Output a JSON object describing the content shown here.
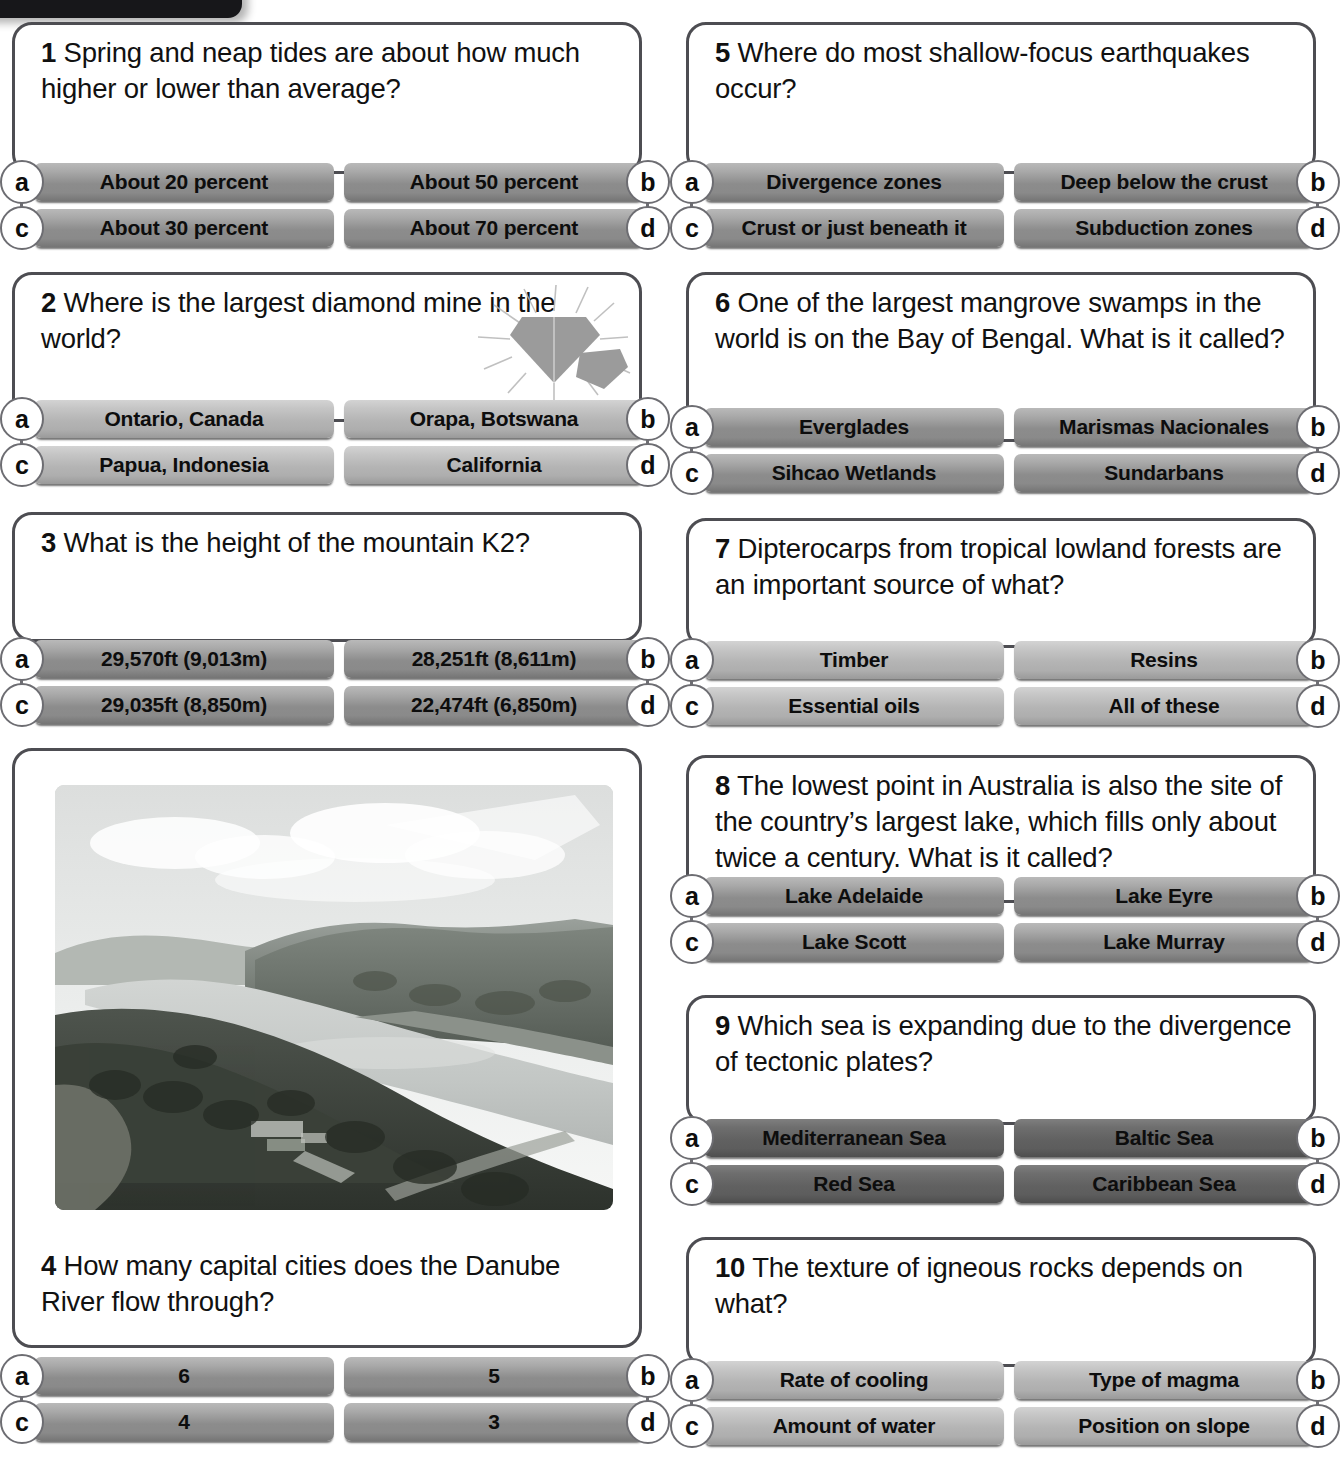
{
  "page": {
    "columns": 2,
    "option_letters": [
      "a",
      "b",
      "c",
      "d"
    ]
  },
  "icons": {
    "diamond": "diamond-gem-icon",
    "photo": "river-valley-photo"
  },
  "questions": [
    {
      "number": "1",
      "text": "Spring and neap tides are about how much higher or lower than average?",
      "shade": "mid",
      "options": [
        {
          "letter": "a",
          "label": "About 20 percent"
        },
        {
          "letter": "b",
          "label": "About 50 percent"
        },
        {
          "letter": "c",
          "label": "About 30 percent"
        },
        {
          "letter": "d",
          "label": "About 70 percent"
        }
      ]
    },
    {
      "number": "2",
      "text": "Where is the largest diamond mine in the world?",
      "shade": "light",
      "icon": "diamond-gem-icon",
      "options": [
        {
          "letter": "a",
          "label": "Ontario, Canada"
        },
        {
          "letter": "b",
          "label": "Orapa, Botswana"
        },
        {
          "letter": "c",
          "label": "Papua, Indonesia"
        },
        {
          "letter": "d",
          "label": "California"
        }
      ]
    },
    {
      "number": "3",
      "text": "What is the height of the mountain K2?",
      "shade": "mid",
      "options": [
        {
          "letter": "a",
          "label": "29,570ft (9,013m)"
        },
        {
          "letter": "b",
          "label": "28,251ft (8,611m)"
        },
        {
          "letter": "c",
          "label": "29,035ft (8,850m)"
        },
        {
          "letter": "d",
          "label": "22,474ft (6,850m)"
        }
      ]
    },
    {
      "number": "4",
      "text": "How many capital cities does the Danube River flow through?",
      "shade": "mid",
      "image": "river-valley-photo",
      "options": [
        {
          "letter": "a",
          "label": "6"
        },
        {
          "letter": "b",
          "label": "5"
        },
        {
          "letter": "c",
          "label": "4"
        },
        {
          "letter": "d",
          "label": "3"
        }
      ]
    },
    {
      "number": "5",
      "text": "Where do most shallow-focus earthquakes occur?",
      "shade": "mid",
      "options": [
        {
          "letter": "a",
          "label": "Divergence zones"
        },
        {
          "letter": "b",
          "label": "Deep below the crust"
        },
        {
          "letter": "c",
          "label": "Crust or just beneath it"
        },
        {
          "letter": "d",
          "label": "Subduction zones"
        }
      ]
    },
    {
      "number": "6",
      "text": "One of the largest mangrove swamps in the world is on the Bay of Bengal. What is it called?",
      "shade": "mid",
      "options": [
        {
          "letter": "a",
          "label": "Everglades"
        },
        {
          "letter": "b",
          "label": "Marismas Nacionales"
        },
        {
          "letter": "c",
          "label": "Sihcao Wetlands"
        },
        {
          "letter": "d",
          "label": "Sundarbans"
        }
      ]
    },
    {
      "number": "7",
      "text": "Dipterocarps from tropical lowland forests are an important source of what?",
      "shade": "light",
      "options": [
        {
          "letter": "a",
          "label": "Timber"
        },
        {
          "letter": "b",
          "label": "Resins"
        },
        {
          "letter": "c",
          "label": "Essential oils"
        },
        {
          "letter": "d",
          "label": "All of these"
        }
      ]
    },
    {
      "number": "8",
      "text": "The lowest point in Australia is also the site of the country’s largest lake, which fills only about twice a century. What is it called?",
      "shade": "mid",
      "options": [
        {
          "letter": "a",
          "label": "Lake Adelaide"
        },
        {
          "letter": "b",
          "label": "Lake Eyre"
        },
        {
          "letter": "c",
          "label": "Lake Scott"
        },
        {
          "letter": "d",
          "label": "Lake Murray"
        }
      ]
    },
    {
      "number": "9",
      "text": "Which sea is expanding due to the divergence of tectonic plates?",
      "shade": "dark",
      "options": [
        {
          "letter": "a",
          "label": "Mediterranean Sea"
        },
        {
          "letter": "b",
          "label": "Baltic Sea"
        },
        {
          "letter": "c",
          "label": "Red Sea"
        },
        {
          "letter": "d",
          "label": "Caribbean Sea"
        }
      ]
    },
    {
      "number": "10",
      "text": "The texture of igneous rocks depends on what?",
      "shade": "light",
      "options": [
        {
          "letter": "a",
          "label": "Rate of cooling"
        },
        {
          "letter": "b",
          "label": "Type of magma"
        },
        {
          "letter": "c",
          "label": "Amount of water"
        },
        {
          "letter": "d",
          "label": "Position on slope"
        }
      ]
    }
  ],
  "colors": {
    "card_border": "#4d4d52",
    "button_mid": "#8c8c8c",
    "button_light": "#b4b4b4",
    "button_dark": "#616161",
    "badge_border": "#6d6d72",
    "tab_black": "#17171a",
    "text": "#111111"
  }
}
